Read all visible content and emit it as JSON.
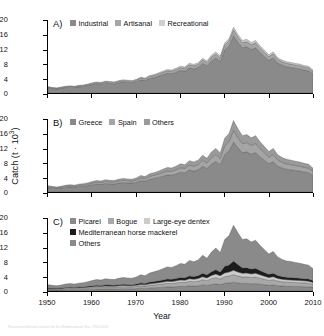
{
  "figure": {
    "axis": {
      "y_title_text": "Catch (t · 10",
      "y_title_sup": "3",
      "y_title_close": ")",
      "x_title": "Year",
      "y_ticks": [
        "20",
        "16",
        "12",
        "8",
        "4",
        "0"
      ],
      "x_ticks": [
        "1950",
        "1960",
        "1970",
        "1980",
        "1990",
        "2000",
        "2010"
      ]
    },
    "panels": [
      {
        "letter": "A)",
        "legend_rows": [
          [
            {
              "label": "Industrial",
              "color": "#8a8a8a"
            },
            {
              "label": "Artisanal",
              "color": "#a5a5a5"
            },
            {
              "label": "Recreational",
              "color": "#cfcfcf"
            }
          ]
        ]
      },
      {
        "letter": "B)",
        "legend_rows": [
          [
            {
              "label": "Greece",
              "color": "#8a8a8a"
            },
            {
              "label": "Spain",
              "color": "#a5a5a5"
            },
            {
              "label": "Others",
              "color": "#9a9a9a"
            }
          ]
        ]
      },
      {
        "letter": "C)",
        "legend_rows": [
          [
            {
              "label": "Picarel",
              "color": "#8a8a8a"
            },
            {
              "label": "Bogue",
              "color": "#a8a8a8"
            },
            {
              "label": "Large-eye dentex",
              "color": "#cccccc"
            }
          ],
          [
            {
              "label": "Mediterranean horse mackerel",
              "color": "#1c1c1c"
            }
          ],
          [
            {
              "label": "Others",
              "color": "#8a8a8a"
            }
          ]
        ]
      }
    ]
  },
  "caption": {
    "text": "Reconstructed total catches for the Mediterranean Sea, 1950-2010"
  },
  "chart_data": {
    "type": "area",
    "title": "",
    "xlabel": "Year",
    "ylabel": "Catch (t · 10^3)",
    "xlim": [
      1950,
      2010
    ],
    "ylim": [
      0,
      20
    ],
    "yticks": [
      0,
      4,
      8,
      12,
      16,
      20
    ],
    "xticks": [
      1950,
      1960,
      1970,
      1980,
      1990,
      2000,
      2010
    ],
    "grid": false,
    "legend_position": "inside-top-left",
    "stacked": true,
    "x": [
      1950,
      1951,
      1952,
      1953,
      1954,
      1955,
      1956,
      1957,
      1958,
      1959,
      1960,
      1961,
      1962,
      1963,
      1964,
      1965,
      1966,
      1967,
      1968,
      1969,
      1970,
      1971,
      1972,
      1973,
      1974,
      1975,
      1976,
      1977,
      1978,
      1979,
      1980,
      1981,
      1982,
      1983,
      1984,
      1985,
      1986,
      1987,
      1988,
      1989,
      1990,
      1991,
      1992,
      1993,
      1994,
      1995,
      1996,
      1997,
      1998,
      1999,
      2000,
      2001,
      2002,
      2003,
      2004,
      2005,
      2006,
      2007,
      2008,
      2009,
      2010
    ],
    "panels": [
      {
        "label": "A)",
        "series": [
          {
            "name": "Industrial",
            "color": "#8a8a8a",
            "values": [
              1.4,
              1.2,
              1.1,
              1.3,
              1.5,
              1.6,
              1.5,
              1.7,
              1.8,
              2.0,
              2.3,
              2.5,
              2.4,
              2.7,
              2.6,
              2.5,
              2.8,
              3.0,
              2.9,
              2.8,
              3.1,
              3.6,
              3.4,
              4.0,
              4.2,
              4.6,
              5.0,
              5.4,
              5.3,
              5.7,
              6.2,
              6.0,
              6.9,
              6.6,
              7.0,
              8.1,
              7.4,
              8.8,
              9.6,
              8.6,
              11.8,
              12.9,
              15.7,
              13.9,
              12.4,
              12.7,
              11.9,
              12.4,
              11.1,
              10.0,
              8.9,
              9.6,
              8.2,
              7.6,
              7.2,
              7.0,
              6.8,
              6.6,
              6.3,
              6.1,
              5.2
            ]
          },
          {
            "name": "Artisanal",
            "color": "#a5a5a5",
            "values": [
              0.22,
              0.2,
              0.19,
              0.21,
              0.23,
              0.24,
              0.23,
              0.26,
              0.27,
              0.3,
              0.33,
              0.35,
              0.34,
              0.38,
              0.37,
              0.36,
              0.4,
              0.42,
              0.41,
              0.4,
              0.44,
              0.5,
              0.48,
              0.55,
              0.58,
              0.62,
              0.66,
              0.7,
              0.69,
              0.74,
              0.8,
              0.78,
              0.86,
              0.84,
              0.88,
              0.98,
              0.92,
              1.05,
              1.12,
              1.04,
              1.3,
              1.38,
              1.58,
              1.46,
              1.36,
              1.38,
              1.32,
              1.36,
              1.26,
              1.18,
              1.08,
              1.14,
              1.02,
              0.97,
              0.94,
              0.92,
              0.9,
              0.88,
              0.85,
              0.83,
              0.74
            ]
          },
          {
            "name": "Recreational",
            "color": "#cfcfcf",
            "values": [
              0.1,
              0.09,
              0.09,
              0.1,
              0.1,
              0.11,
              0.1,
              0.12,
              0.12,
              0.13,
              0.15,
              0.16,
              0.15,
              0.17,
              0.17,
              0.16,
              0.18,
              0.19,
              0.18,
              0.18,
              0.2,
              0.22,
              0.21,
              0.24,
              0.26,
              0.28,
              0.3,
              0.32,
              0.31,
              0.33,
              0.36,
              0.35,
              0.39,
              0.38,
              0.4,
              0.44,
              0.42,
              0.48,
              0.51,
              0.47,
              0.59,
              0.63,
              0.72,
              0.66,
              0.62,
              0.63,
              0.6,
              0.62,
              0.57,
              0.54,
              0.49,
              0.52,
              0.46,
              0.44,
              0.43,
              0.42,
              0.41,
              0.4,
              0.39,
              0.38,
              0.34
            ]
          }
        ]
      },
      {
        "label": "B)",
        "series": [
          {
            "name": "Greece",
            "color": "#8a8a8a",
            "values": [
              1.2,
              1.05,
              0.95,
              1.1,
              1.3,
              1.4,
              1.3,
              1.5,
              1.6,
              1.75,
              2.0,
              2.2,
              2.1,
              2.35,
              2.25,
              2.2,
              2.45,
              2.6,
              2.5,
              2.45,
              2.7,
              3.15,
              2.95,
              3.5,
              3.7,
              4.0,
              4.35,
              4.7,
              4.6,
              4.95,
              5.4,
              5.25,
              6.0,
              5.75,
              6.1,
              7.05,
              6.45,
              7.65,
              8.35,
              7.5,
              10.3,
              11.2,
              13.7,
              12.1,
              10.8,
              11.0,
              10.4,
              10.8,
              9.65,
              8.7,
              7.75,
              8.35,
              7.15,
              6.6,
              6.25,
              6.1,
              5.9,
              5.75,
              5.5,
              5.3,
              4.55
            ]
          },
          {
            "name": "Spain",
            "color": "#a5a5a5",
            "values": [
              0.28,
              0.25,
              0.23,
              0.26,
              0.3,
              0.32,
              0.3,
              0.35,
              0.37,
              0.4,
              0.46,
              0.5,
              0.48,
              0.54,
              0.52,
              0.5,
              0.56,
              0.6,
              0.58,
              0.56,
              0.62,
              0.72,
              0.68,
              0.8,
              0.85,
              0.92,
              1.0,
              1.08,
              1.06,
              1.14,
              1.24,
              1.2,
              1.38,
              1.32,
              1.4,
              1.62,
              1.48,
              1.76,
              1.92,
              1.72,
              2.36,
              2.58,
              3.14,
              2.78,
              2.48,
              2.54,
              2.38,
              2.48,
              2.22,
              2.0,
              1.78,
              1.92,
              1.64,
              1.52,
              1.44,
              1.4,
              1.36,
              1.32,
              1.26,
              1.22,
              1.05
            ]
          },
          {
            "name": "Others",
            "color": "#9a9a9a",
            "values": [
              0.24,
              0.21,
              0.2,
              0.23,
              0.26,
              0.28,
              0.26,
              0.3,
              0.32,
              0.35,
              0.4,
              0.43,
              0.42,
              0.47,
              0.45,
              0.44,
              0.49,
              0.52,
              0.5,
              0.49,
              0.54,
              0.63,
              0.59,
              0.7,
              0.74,
              0.8,
              0.87,
              0.94,
              0.92,
              0.99,
              1.08,
              1.05,
              1.2,
              1.15,
              1.22,
              1.41,
              1.29,
              1.53,
              1.67,
              1.5,
              2.06,
              2.24,
              2.73,
              2.42,
              2.16,
              2.21,
              2.08,
              2.16,
              1.93,
              1.74,
              1.55,
              1.67,
              1.43,
              1.32,
              1.25,
              1.22,
              1.18,
              1.15,
              1.1,
              1.06,
              0.91
            ]
          }
        ]
      },
      {
        "label": "C)",
        "series": [
          {
            "name": "Picarel",
            "color": "#8a8a8a",
            "values": [
              0.3,
              0.28,
              0.26,
              0.3,
              0.34,
              0.36,
              0.34,
              0.38,
              0.4,
              0.44,
              0.5,
              0.54,
              0.52,
              0.58,
              0.56,
              0.54,
              0.6,
              0.64,
              0.62,
              0.6,
              0.66,
              0.76,
              0.72,
              0.84,
              0.9,
              0.96,
              1.04,
              1.12,
              1.1,
              1.18,
              1.28,
              1.24,
              1.42,
              1.36,
              1.44,
              1.66,
              1.52,
              1.8,
              1.96,
              1.76,
              2.1,
              2.2,
              2.4,
              2.2,
              2.05,
              2.08,
              1.98,
              2.05,
              1.88,
              1.72,
              1.56,
              1.66,
              1.46,
              1.36,
              1.3,
              1.28,
              1.25,
              1.22,
              1.18,
              1.14,
              1.0
            ]
          },
          {
            "name": "Bogue",
            "color": "#a8a8a8",
            "values": [
              0.26,
              0.24,
              0.22,
              0.25,
              0.29,
              0.31,
              0.29,
              0.33,
              0.35,
              0.38,
              0.43,
              0.47,
              0.45,
              0.5,
              0.48,
              0.47,
              0.52,
              0.55,
              0.53,
              0.52,
              0.57,
              0.66,
              0.62,
              0.73,
              0.78,
              0.83,
              0.9,
              0.97,
              0.95,
              1.02,
              1.11,
              1.08,
              1.23,
              1.18,
              1.25,
              1.44,
              1.32,
              1.56,
              1.7,
              1.53,
              1.82,
              1.91,
              2.08,
              1.91,
              1.78,
              1.8,
              1.72,
              1.78,
              1.63,
              1.49,
              1.35,
              1.44,
              1.27,
              1.18,
              1.13,
              1.11,
              1.08,
              1.06,
              1.02,
              0.99,
              0.87
            ]
          },
          {
            "name": "Large-eye dentex",
            "color": "#cccccc",
            "values": [
              0.14,
              0.13,
              0.12,
              0.14,
              0.16,
              0.17,
              0.16,
              0.18,
              0.19,
              0.21,
              0.24,
              0.26,
              0.25,
              0.28,
              0.27,
              0.26,
              0.29,
              0.31,
              0.3,
              0.29,
              0.32,
              0.37,
              0.35,
              0.41,
              0.44,
              0.47,
              0.51,
              0.55,
              0.54,
              0.58,
              0.63,
              0.61,
              0.7,
              0.67,
              0.71,
              0.82,
              0.75,
              0.89,
              0.97,
              0.87,
              1.04,
              1.09,
              1.19,
              1.09,
              1.02,
              1.03,
              0.98,
              1.02,
              0.93,
              0.85,
              0.77,
              0.82,
              0.72,
              0.67,
              0.64,
              0.63,
              0.62,
              0.6,
              0.58,
              0.56,
              0.49
            ]
          },
          {
            "name": "Mediterranean horse mackerel",
            "color": "#1c1c1c",
            "values": [
              0.16,
              0.14,
              0.13,
              0.15,
              0.18,
              0.19,
              0.18,
              0.2,
              0.22,
              0.24,
              0.27,
              0.29,
              0.28,
              0.31,
              0.3,
              0.29,
              0.33,
              0.35,
              0.33,
              0.32,
              0.36,
              0.42,
              0.39,
              0.46,
              0.49,
              0.53,
              0.57,
              0.62,
              0.6,
              0.65,
              0.71,
              0.69,
              0.78,
              0.75,
              0.8,
              0.92,
              0.84,
              1.0,
              1.22,
              1.05,
              1.8,
              1.95,
              2.55,
              2.05,
              1.55,
              1.48,
              1.32,
              1.35,
              1.18,
              1.02,
              0.88,
              0.94,
              0.8,
              0.73,
              0.69,
              0.67,
              0.65,
              0.63,
              0.6,
              0.58,
              0.5
            ]
          },
          {
            "name": "Others",
            "color": "#8a8a8a",
            "values": [
              0.86,
              0.76,
              0.7,
              0.8,
              0.93,
              1.0,
              0.93,
              1.06,
              1.13,
              1.25,
              1.43,
              1.56,
              1.5,
              1.68,
              1.61,
              1.57,
              1.75,
              1.86,
              1.79,
              1.75,
              1.93,
              2.23,
              2.1,
              2.47,
              2.63,
              2.85,
              3.09,
              3.34,
              3.27,
              3.52,
              3.83,
              3.72,
              4.25,
              4.07,
              4.32,
              4.98,
              4.56,
              5.4,
              5.92,
              5.35,
              7.36,
              8.03,
              9.79,
              8.69,
              7.73,
              7.91,
              7.43,
              7.72,
              6.9,
              6.22,
              5.6,
              5.98,
              5.1,
              4.72,
              4.46,
              4.36,
              4.22,
              4.11,
              3.94,
              3.8,
              3.25
            ]
          }
        ]
      }
    ]
  }
}
